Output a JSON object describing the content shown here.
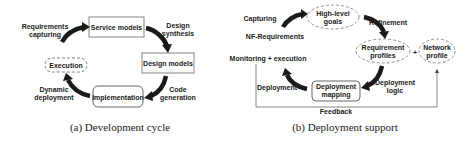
{
  "figure_a": {
    "caption": "(a) Development cycle",
    "nodes": {
      "service_models": "Service models",
      "design_models": "Design models",
      "implementation": "Implementation",
      "execution": "Execution"
    },
    "edges": {
      "requirements_capturing": [
        "Requirements",
        "capturing"
      ],
      "design_synthesis": [
        "Design",
        "synthesis"
      ],
      "code_generation": [
        "Code",
        "generation"
      ],
      "dynamic_deployment": [
        "Dynamic",
        "deployment"
      ]
    }
  },
  "figure_b": {
    "caption": "(b) Deployment support",
    "nodes": {
      "high_level_goals": [
        "High-level",
        "goals"
      ],
      "requirement_profiles": [
        "Requirement",
        "profiles"
      ],
      "network_profile": [
        "Network",
        "profile"
      ],
      "deployment_mapping": [
        "Deployment",
        "mapping"
      ]
    },
    "plus": "+",
    "edges": {
      "capturing": "Capturing",
      "nf_requirements": "NF-Requirements",
      "refinement": "Refinement",
      "deployment_logic": [
        "Deployment",
        "logic"
      ],
      "deployment": "Deployment",
      "monitoring_execution": "Monitoring + execution",
      "feedback": "Feedback"
    }
  },
  "colors": {
    "stroke": "#555555",
    "arrow": "#1a1a1a",
    "text": "#222222"
  }
}
